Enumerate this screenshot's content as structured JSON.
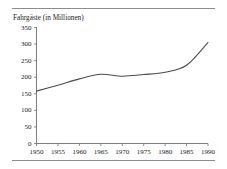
{
  "chart_data": {
    "type": "line",
    "title": "Fahrgäste (in Millionen)",
    "xlabel": "",
    "ylabel": "",
    "x": [
      1950,
      1955,
      1960,
      1965,
      1970,
      1975,
      1980,
      1985,
      1990
    ],
    "values": [
      158,
      176,
      195,
      209,
      203,
      208,
      215,
      236,
      305
    ],
    "series": [
      {
        "name": "Fahrgäste (in Millionen)",
        "values": [
          158,
          176,
          195,
          209,
          203,
          208,
          215,
          236,
          305
        ]
      }
    ],
    "xlim": [
      1950,
      1990
    ],
    "ylim": [
      0,
      350
    ],
    "ytick_labels": [
      "0",
      "50",
      "100",
      "150",
      "200",
      "250",
      "300",
      "350"
    ],
    "yticks": [
      0,
      50,
      100,
      150,
      200,
      250,
      300,
      350
    ],
    "xtick_labels": [
      "1950",
      "1955",
      "1960",
      "1965",
      "1970",
      "1975",
      "1980",
      "1985",
      "1990"
    ],
    "xticks": [
      1950,
      1955,
      1960,
      1965,
      1970,
      1975,
      1980,
      1985,
      1990
    ],
    "grid": false,
    "legend": false,
    "legend_position": "none",
    "line_color": "#4a4a4a",
    "axis_color": "#6f6f6f",
    "background_color": "#ffffff"
  },
  "figure": {
    "rule_color": "#8d8d8d",
    "top_rule_name": "top-divider",
    "bottom_rule_name": "bottom-divider"
  }
}
